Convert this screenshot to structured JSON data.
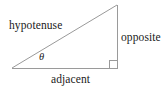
{
  "diagram": {
    "type": "right-triangle-trigonometry",
    "background_color": "#ffffff",
    "line_color": "#9a9a9a",
    "text_color": "#1a1a1a",
    "labels": {
      "hypotenuse": "hypotenuse",
      "opposite": "opposite",
      "adjacent": "adjacent",
      "angle": "θ"
    },
    "vertices": {
      "left": [
        12,
        68
      ],
      "bottom_right": [
        117,
        68
      ],
      "top_right": [
        117,
        5
      ]
    },
    "right_angle_marker": {
      "x": 109,
      "y": 60,
      "size": 8
    }
  }
}
